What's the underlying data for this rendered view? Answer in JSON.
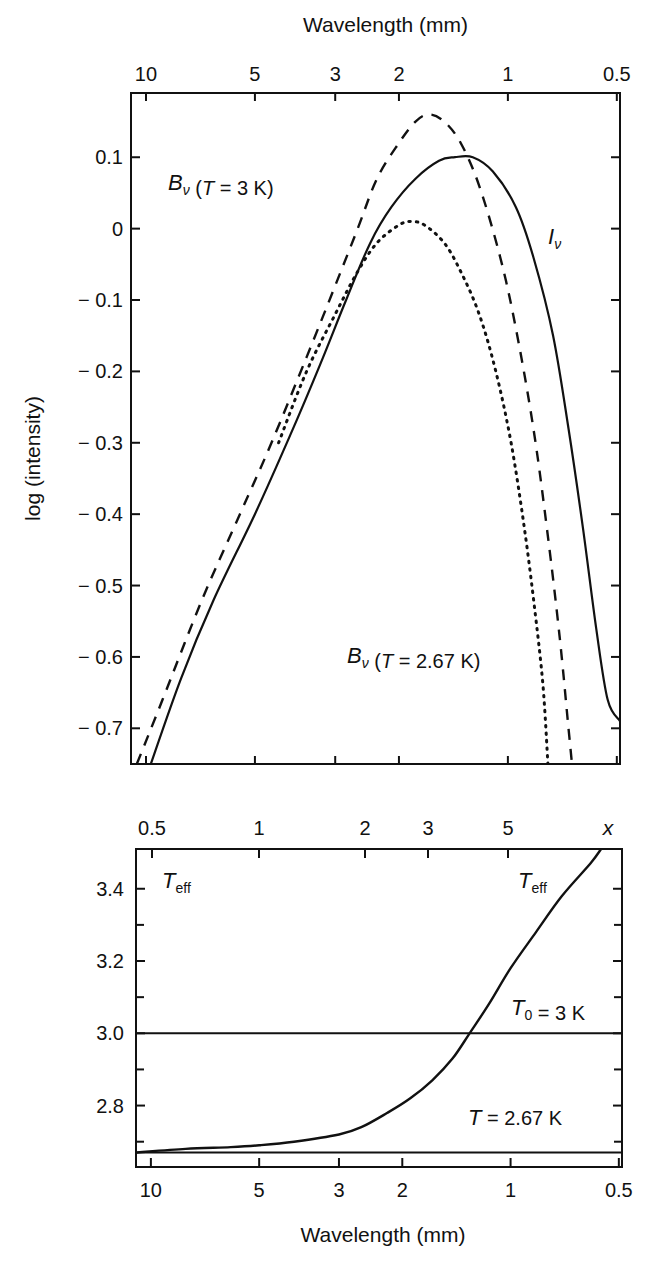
{
  "chart_data": [
    {
      "id": "spectrum",
      "type": "line",
      "title": "",
      "xlabel_top": "Wavelength (mm)",
      "ylabel": "log (intensity)",
      "x_scale": "log",
      "x_reversed": true,
      "xlim_mm": [
        11.0,
        0.49
      ],
      "ylim": [
        -0.75,
        0.19
      ],
      "x_ticks_top": [
        {
          "value": 10,
          "label": "10"
        },
        {
          "value": 5,
          "label": "5"
        },
        {
          "value": 3,
          "label": "3"
        },
        {
          "value": 2,
          "label": "2"
        },
        {
          "value": 1,
          "label": "1"
        },
        {
          "value": 0.5,
          "label": "0.5"
        }
      ],
      "y_ticks": [
        {
          "value": 0.1,
          "label": "0.1"
        },
        {
          "value": 0,
          "label": "0"
        },
        {
          "value": -0.1,
          "label": "− 0.1"
        },
        {
          "value": -0.2,
          "label": "− 0.2"
        },
        {
          "value": -0.3,
          "label": "− 0.3"
        },
        {
          "value": -0.4,
          "label": "− 0.4"
        },
        {
          "value": -0.5,
          "label": "− 0.5"
        },
        {
          "value": -0.6,
          "label": "− 0.6"
        },
        {
          "value": -0.7,
          "label": "− 0.7"
        }
      ],
      "grid": false,
      "series": [
        {
          "name": "B_nu (T = 3 K)",
          "style": "dashed",
          "points_mm_logI": [
            [
              10.6,
              -0.75
            ],
            [
              9.0,
              -0.66
            ],
            [
              7.0,
              -0.52
            ],
            [
              5.5,
              -0.4
            ],
            [
              4.5,
              -0.3
            ],
            [
              3.6,
              -0.18
            ],
            [
              3.0,
              -0.08
            ],
            [
              2.6,
              0.0
            ],
            [
              2.3,
              0.07
            ],
            [
              2.0,
              0.12
            ],
            [
              1.8,
              0.15
            ],
            [
              1.65,
              0.16
            ],
            [
              1.5,
              0.15
            ],
            [
              1.35,
              0.12
            ],
            [
              1.2,
              0.06
            ],
            [
              1.05,
              -0.04
            ],
            [
              0.95,
              -0.14
            ],
            [
              0.85,
              -0.28
            ],
            [
              0.78,
              -0.42
            ],
            [
              0.72,
              -0.57
            ],
            [
              0.68,
              -0.7
            ],
            [
              0.665,
              -0.75
            ]
          ]
        },
        {
          "name": "I_nu",
          "style": "solid",
          "points_mm_logI": [
            [
              9.7,
              -0.75
            ],
            [
              8.0,
              -0.63
            ],
            [
              6.5,
              -0.52
            ],
            [
              5.0,
              -0.4
            ],
            [
              4.0,
              -0.29
            ],
            [
              3.3,
              -0.19
            ],
            [
              2.8,
              -0.1
            ],
            [
              2.4,
              -0.02
            ],
            [
              2.1,
              0.03
            ],
            [
              1.8,
              0.07
            ],
            [
              1.55,
              0.095
            ],
            [
              1.4,
              0.1
            ],
            [
              1.25,
              0.1
            ],
            [
              1.1,
              0.08
            ],
            [
              0.95,
              0.03
            ],
            [
              0.85,
              -0.04
            ],
            [
              0.75,
              -0.15
            ],
            [
              0.68,
              -0.28
            ],
            [
              0.62,
              -0.42
            ],
            [
              0.57,
              -0.56
            ],
            [
              0.53,
              -0.66
            ],
            [
              0.49,
              -0.69
            ]
          ]
        },
        {
          "name": "B_nu (T = 2.67 K)",
          "style": "dotted",
          "points_mm_logI": [
            [
              4.3,
              -0.3
            ],
            [
              3.6,
              -0.2
            ],
            [
              3.0,
              -0.12
            ],
            [
              2.6,
              -0.06
            ],
            [
              2.3,
              -0.02
            ],
            [
              2.0,
              0.005
            ],
            [
              1.85,
              0.01
            ],
            [
              1.7,
              0.005
            ],
            [
              1.5,
              -0.02
            ],
            [
              1.35,
              -0.06
            ],
            [
              1.2,
              -0.12
            ],
            [
              1.08,
              -0.2
            ],
            [
              0.98,
              -0.3
            ],
            [
              0.9,
              -0.42
            ],
            [
              0.84,
              -0.54
            ],
            [
              0.8,
              -0.64
            ],
            [
              0.775,
              -0.75
            ]
          ]
        }
      ],
      "annotations": [
        {
          "text_main": "B",
          "text_sub": "ν",
          "text_rest": " (T = 3 K)",
          "x_px": 168,
          "y_px": 190
        },
        {
          "text_main": "I",
          "text_sub": "ν",
          "text_rest": "",
          "x_px": 548,
          "y_px": 244
        },
        {
          "text_main": "B",
          "text_sub": "ν",
          "text_rest": " (T = 2.67 K)",
          "x_px": 347,
          "y_px": 663
        }
      ]
    },
    {
      "id": "teff",
      "type": "line",
      "title": "",
      "xlabel": "Wavelength (mm)",
      "xlabel_top": "x",
      "ylabel": "",
      "x_scale": "log",
      "x_reversed": true,
      "xlim_mm": [
        11.0,
        0.49
      ],
      "ylim": [
        2.63,
        3.51
      ],
      "x_ticks_bottom": [
        {
          "value": 10,
          "label": "10"
        },
        {
          "value": 5,
          "label": "5"
        },
        {
          "value": 3,
          "label": "3"
        },
        {
          "value": 2,
          "label": "2"
        },
        {
          "value": 1,
          "label": "1"
        },
        {
          "value": 0.5,
          "label": "0.5"
        }
      ],
      "x_ticks_top": [
        {
          "value_x": 0.5,
          "label": "0.5"
        },
        {
          "value_x": 1,
          "label": "1"
        },
        {
          "value_x": 2,
          "label": "2"
        },
        {
          "value_x": 3,
          "label": "3"
        },
        {
          "value_x": 5,
          "label": "5"
        }
      ],
      "y_ticks": [
        {
          "value": 3.4,
          "label": "3.4"
        },
        {
          "value": 3.2,
          "label": "3.2"
        },
        {
          "value": 3.0,
          "label": "3.0"
        },
        {
          "value": 2.8,
          "label": "2.8"
        }
      ],
      "y_minor_ticks": [
        3.3,
        3.1,
        2.9,
        2.7
      ],
      "grid": false,
      "series": [
        {
          "name": "T_eff",
          "style": "solid",
          "points_mm_K": [
            [
              11.0,
              2.67
            ],
            [
              8.0,
              2.68
            ],
            [
              6.0,
              2.685
            ],
            [
              5.0,
              2.69
            ],
            [
              4.0,
              2.7
            ],
            [
              3.0,
              2.72
            ],
            [
              2.6,
              2.74
            ],
            [
              2.2,
              2.78
            ],
            [
              1.9,
              2.82
            ],
            [
              1.65,
              2.87
            ],
            [
              1.45,
              2.93
            ],
            [
              1.3,
              3.0
            ],
            [
              1.15,
              3.08
            ],
            [
              1.0,
              3.18
            ],
            [
              0.85,
              3.28
            ],
            [
              0.72,
              3.38
            ],
            [
              0.6,
              3.47
            ],
            [
              0.56,
              3.51
            ]
          ]
        },
        {
          "name": "T0 = 3 K",
          "style": "solid",
          "constant": 3.0
        },
        {
          "name": "T = 2.67 K",
          "style": "solid",
          "constant": 2.67
        }
      ],
      "annotations": [
        {
          "text_main": "T",
          "text_sub": "eff",
          "x_px": 162,
          "y_px": 888
        },
        {
          "text_main": "T",
          "text_sub": "eff",
          "x_px": 518,
          "y_px": 888
        },
        {
          "text_main": "T",
          "text_sub": "0",
          "text_rest": " = 3 K",
          "x_px": 511,
          "y_px": 1015
        },
        {
          "text_main": "T",
          "text_sub": "",
          "text_rest": " = 2.67 K",
          "x_px": 468,
          "y_px": 1125
        }
      ]
    }
  ],
  "layout": {
    "top_panel": {
      "left": 131,
      "right": 620,
      "top": 93,
      "bottom": 764
    },
    "bottom_panel": {
      "left": 136,
      "right": 622,
      "top": 849,
      "bottom": 1167
    },
    "line_color": "#111111",
    "background": "#ffffff"
  }
}
